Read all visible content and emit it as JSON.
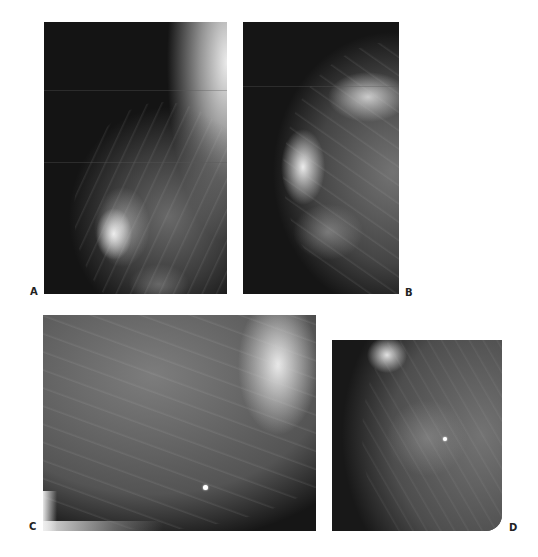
{
  "figure": {
    "background_color": "#ffffff",
    "panels": [
      {
        "id": "A",
        "label": "A",
        "view": "mediolateral oblique mammogram",
        "marker": false
      },
      {
        "id": "B",
        "label": "B",
        "view": "craniocaudal mammogram",
        "marker": false
      },
      {
        "id": "C",
        "label": "C",
        "view": "magnified lateral mammogram",
        "marker": true
      },
      {
        "id": "D",
        "label": "D",
        "view": "spot-compression mammogram",
        "marker": true
      }
    ]
  }
}
